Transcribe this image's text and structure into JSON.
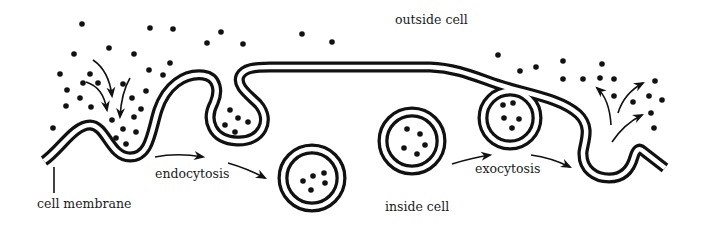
{
  "diagram": {
    "labels": {
      "outside": "outside cell",
      "inside": "inside cell",
      "membrane": "cell membrane",
      "endocytosis": "endocytosis",
      "exocytosis": "exocytosis"
    },
    "colors": {
      "ink": "#111111",
      "background": "#ffffff"
    },
    "membrane_path": "M 44,161 C 60,150 74,125 90,125 C 106,125 110,157 130,157 C 150,157 151,132 158,110 C 166,86 184,73 203,75 C 218,77 219,92 214,103 C 205,120 212,140 237,141 C 262,142 272,120 258,104 C 248,94 236,86 240,76 C 244,68 255,67 270,67 L 430,67 C 458,68 478,78 500,85 C 528,94 560,98 578,114 C 592,127 584,142 583,152 C 582,170 596,178 609,178 C 624,178 631,168 634,157 C 636,150 639,147 643,151 L 665,168",
    "membrane_vesicle": {
      "cx": 510,
      "cy": 118,
      "r": 27
    },
    "vesicles": [
      {
        "name": "free-vesicle-endocytosis",
        "cx": 312,
        "cy": 178,
        "r": 29,
        "dots": [
          [
            313,
            176
          ],
          [
            324,
            173
          ],
          [
            303,
            181
          ],
          [
            325,
            183
          ],
          [
            311,
            190
          ]
        ]
      },
      {
        "name": "free-vesicle-inside",
        "cx": 412,
        "cy": 141,
        "r": 29,
        "dots": [
          [
            407,
            129
          ],
          [
            420,
            134
          ],
          [
            404,
            148
          ],
          [
            425,
            145
          ],
          [
            417,
            154
          ]
        ]
      }
    ],
    "bulb_dots": [
      [
        230,
        110
      ],
      [
        238,
        118
      ],
      [
        248,
        122
      ],
      [
        225,
        125
      ],
      [
        235,
        132
      ]
    ],
    "membrane_vesicle_dots": [
      [
        503,
        105
      ],
      [
        513,
        103
      ],
      [
        504,
        118
      ],
      [
        519,
        119
      ],
      [
        512,
        128
      ]
    ],
    "outside_dots": [
      [
        82,
        24
      ],
      [
        150,
        28
      ],
      [
        173,
        29
      ],
      [
        109,
        48
      ],
      [
        74,
        54
      ],
      [
        134,
        54
      ],
      [
        170,
        63
      ],
      [
        149,
        70
      ],
      [
        163,
        75
      ],
      [
        60,
        74
      ],
      [
        90,
        74
      ],
      [
        83,
        83
      ],
      [
        98,
        83
      ],
      [
        123,
        84
      ],
      [
        67,
        90
      ],
      [
        146,
        91
      ],
      [
        80,
        98
      ],
      [
        132,
        98
      ],
      [
        66,
        106
      ],
      [
        91,
        107
      ],
      [
        141,
        109
      ],
      [
        112,
        120
      ],
      [
        134,
        117
      ],
      [
        53,
        128
      ],
      [
        123,
        129
      ],
      [
        136,
        132
      ],
      [
        116,
        138
      ],
      [
        126,
        144
      ],
      [
        221,
        32
      ],
      [
        207,
        43
      ],
      [
        243,
        44
      ],
      [
        302,
        34
      ],
      [
        332,
        42
      ],
      [
        498,
        55
      ],
      [
        520,
        71
      ],
      [
        536,
        67
      ],
      [
        563,
        61
      ],
      [
        563,
        79
      ],
      [
        583,
        79
      ],
      [
        602,
        64
      ],
      [
        600,
        78
      ],
      [
        614,
        79
      ],
      [
        614,
        96
      ],
      [
        633,
        102
      ],
      [
        649,
        96
      ],
      [
        662,
        100
      ],
      [
        655,
        81
      ],
      [
        651,
        113
      ],
      [
        654,
        128
      ]
    ],
    "arrows": [
      {
        "name": "influx-arrow-1",
        "d": "M 93,60 C 105,68 110,80 112,96"
      },
      {
        "name": "influx-arrow-2",
        "d": "M 86,82 C 98,86 104,94 107,110"
      },
      {
        "name": "influx-arrow-3",
        "d": "M 130,78 C 124,88 121,100 120,117"
      },
      {
        "name": "endocytosis-arrow-1",
        "d": "M 155,157 C 170,154 185,154 203,157"
      },
      {
        "name": "endocytosis-arrow-2",
        "d": "M 228,163 C 242,167 252,171 265,178"
      },
      {
        "name": "exocytosis-arrow-1",
        "d": "M 452,164 C 465,160 476,157 490,155"
      },
      {
        "name": "exocytosis-arrow-2",
        "d": "M 531,155 C 546,157 558,161 570,167"
      },
      {
        "name": "release-arrow-1",
        "d": "M 611,125 C 610,108 606,96 597,88"
      },
      {
        "name": "release-arrow-2",
        "d": "M 618,113 C 622,100 630,90 643,83"
      },
      {
        "name": "release-arrow-3",
        "d": "M 612,142 C 620,130 630,121 642,115"
      }
    ],
    "membrane_leader": {
      "x": 54,
      "y1": 167,
      "y2": 193
    }
  }
}
